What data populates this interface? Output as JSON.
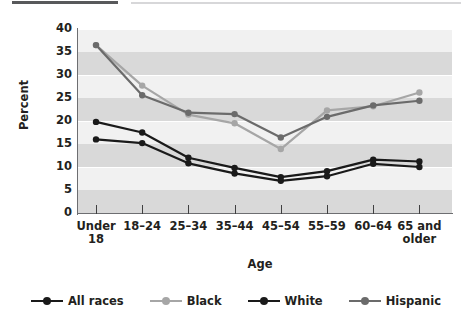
{
  "chart_data": {
    "type": "line",
    "title": "",
    "xlabel": "Age",
    "ylabel": "Percent",
    "ylim": [
      0,
      40
    ],
    "ytick_step": 5,
    "yticks": [
      "0",
      "5",
      "10",
      "15",
      "20",
      "25",
      "30",
      "35",
      "40"
    ],
    "grid": true,
    "grid_style": "alternating horizontal bands",
    "legend_position": "bottom",
    "categories": [
      "Under 18",
      "18–24",
      "25–34",
      "35–44",
      "45–54",
      "55–59",
      "60–64",
      "65 and older"
    ],
    "category_lines": [
      [
        "Under",
        "18"
      ],
      [
        "18–24",
        ""
      ],
      [
        "25–34",
        ""
      ],
      [
        "35–44",
        ""
      ],
      [
        "45–54",
        ""
      ],
      [
        "55–59",
        ""
      ],
      [
        "60–64",
        ""
      ],
      [
        "65 and",
        "older"
      ]
    ],
    "series": [
      {
        "name": "All races",
        "color": "#1a1a1a",
        "values": [
          19.8,
          17.5,
          12.0,
          9.8,
          7.8,
          9.1,
          11.6,
          11.2
        ]
      },
      {
        "name": "Black",
        "color": "#a6a6a6",
        "values": [
          36.5,
          27.7,
          21.4,
          19.5,
          13.9,
          22.3,
          23.2,
          26.2
        ]
      },
      {
        "name": "White",
        "color": "#1a1a1a",
        "values": [
          16.0,
          15.2,
          10.8,
          8.6,
          7.0,
          8.0,
          10.7,
          10.0
        ]
      },
      {
        "name": "Hispanic",
        "color": "#6b6b6b",
        "values": [
          36.5,
          25.6,
          21.8,
          21.5,
          16.4,
          20.9,
          23.4,
          24.4
        ]
      }
    ]
  },
  "legend": {
    "items": [
      {
        "label": "All races",
        "color": "#1a1a1a"
      },
      {
        "label": "Black",
        "color": "#a6a6a6"
      },
      {
        "label": "White",
        "color": "#1a1a1a"
      },
      {
        "label": "Hispanic",
        "color": "#6b6b6b"
      }
    ]
  },
  "axes": {
    "y_title": "Percent",
    "x_title": "Age"
  }
}
